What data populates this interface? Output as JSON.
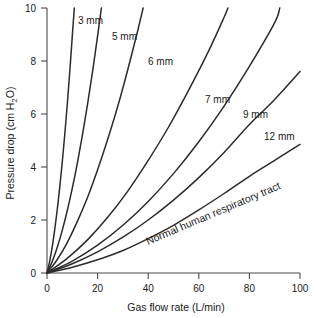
{
  "chart_data": {
    "type": "line",
    "title": "",
    "xlabel": "Gas flow rate (L/min)",
    "ylabel": "Pressure drop (cm H2O)",
    "ylabel_display": "Pressure drop (cm H",
    "ylabel_sub": "2",
    "ylabel_tail": "O)",
    "xlim": [
      0,
      100
    ],
    "ylim": [
      0,
      10
    ],
    "xticks": [
      0,
      20,
      40,
      60,
      80,
      100
    ],
    "yticks": [
      0,
      2,
      4,
      6,
      8,
      10
    ],
    "xtick_labels": [
      "0",
      "20",
      "40",
      "60",
      "80",
      "100"
    ],
    "ytick_labels": [
      "0",
      "2",
      "4",
      "6",
      "8",
      "10"
    ],
    "grid": false,
    "legend_position": "inline-curve-labels",
    "line_color": "#2b2b2b",
    "axis_color": "#4a4a4a",
    "annotations": [
      {
        "text": "Normal human respiratory tract",
        "kind": "rotated-curve-label"
      }
    ],
    "series": [
      {
        "name": "3 mm",
        "label": "3 mm",
        "points": [
          [
            0,
            0
          ],
          [
            1,
            0.42
          ],
          [
            2,
            0.95
          ],
          [
            3,
            1.6
          ],
          [
            4,
            2.35
          ],
          [
            5,
            3.2
          ],
          [
            6,
            4.15
          ],
          [
            7,
            5.2
          ],
          [
            8,
            6.35
          ],
          [
            9,
            7.6
          ],
          [
            10,
            8.95
          ],
          [
            10.8,
            10.0
          ]
        ]
      },
      {
        "name": "5 mm",
        "label": "5 mm",
        "points": [
          [
            0,
            0
          ],
          [
            2,
            0.42
          ],
          [
            4,
            0.95
          ],
          [
            6,
            1.6
          ],
          [
            8,
            2.35
          ],
          [
            10,
            3.2
          ],
          [
            12,
            4.15
          ],
          [
            14,
            5.2
          ],
          [
            16,
            6.35
          ],
          [
            18,
            7.6
          ],
          [
            20,
            8.95
          ],
          [
            21.5,
            10.0
          ]
        ]
      },
      {
        "name": "6 mm",
        "label": "6 mm",
        "points": [
          [
            0,
            0
          ],
          [
            4,
            0.5
          ],
          [
            8,
            1.15
          ],
          [
            12,
            1.95
          ],
          [
            16,
            2.85
          ],
          [
            20,
            3.9
          ],
          [
            24,
            5.05
          ],
          [
            28,
            6.3
          ],
          [
            32,
            7.7
          ],
          [
            36,
            9.2
          ],
          [
            38,
            10.0
          ]
        ]
      },
      {
        "name": "7 mm",
        "label": "7 mm",
        "points": [
          [
            0,
            0
          ],
          [
            8,
            0.55
          ],
          [
            16,
            1.25
          ],
          [
            24,
            2.1
          ],
          [
            32,
            3.1
          ],
          [
            40,
            4.25
          ],
          [
            48,
            5.5
          ],
          [
            56,
            6.9
          ],
          [
            64,
            8.4
          ],
          [
            70,
            9.65
          ],
          [
            71.5,
            10.0
          ]
        ]
      },
      {
        "name": "9 mm",
        "label": "9 mm",
        "points": [
          [
            0,
            0
          ],
          [
            10,
            0.45
          ],
          [
            20,
            1.05
          ],
          [
            30,
            1.8
          ],
          [
            40,
            2.7
          ],
          [
            50,
            3.75
          ],
          [
            60,
            4.95
          ],
          [
            70,
            6.3
          ],
          [
            80,
            7.8
          ],
          [
            90,
            9.45
          ],
          [
            92,
            10.0
          ]
        ]
      },
      {
        "name": "12 mm",
        "label": "12 mm",
        "points": [
          [
            0,
            0
          ],
          [
            10,
            0.35
          ],
          [
            20,
            0.8
          ],
          [
            30,
            1.35
          ],
          [
            40,
            2.0
          ],
          [
            50,
            2.75
          ],
          [
            60,
            3.6
          ],
          [
            70,
            4.55
          ],
          [
            80,
            5.6
          ],
          [
            90,
            6.55
          ],
          [
            100,
            7.6
          ]
        ]
      },
      {
        "name": "Normal human respiratory tract",
        "label": "Normal human respiratory tract",
        "points": [
          [
            0,
            0
          ],
          [
            10,
            0.22
          ],
          [
            20,
            0.5
          ],
          [
            30,
            0.85
          ],
          [
            40,
            1.3
          ],
          [
            50,
            1.8
          ],
          [
            60,
            2.38
          ],
          [
            70,
            3.0
          ],
          [
            80,
            3.65
          ],
          [
            90,
            4.25
          ],
          [
            100,
            4.85
          ]
        ]
      }
    ]
  },
  "series_labels": {
    "s3": "3 mm",
    "s5": "5 mm",
    "s6": "6 mm",
    "s7": "7 mm",
    "s9": "9 mm",
    "s12": "12 mm",
    "normal": "Normal human respiratory tract"
  },
  "axes": {
    "x_title": "Gas flow rate (L/min)",
    "y_title_head": "Pressure drop (cm H",
    "y_title_sub": "2",
    "y_title_tail": "O)"
  },
  "ticks": {
    "x": [
      "0",
      "20",
      "40",
      "60",
      "80",
      "100"
    ],
    "y": [
      "0",
      "2",
      "4",
      "6",
      "8",
      "10"
    ]
  }
}
